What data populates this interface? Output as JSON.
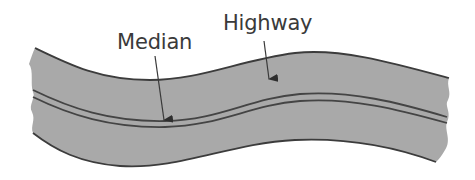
{
  "diagram": {
    "labels": {
      "median": "Median",
      "highway": "Highway"
    },
    "colors": {
      "road_fill": "#a9a9a9",
      "edge_stroke": "#3c3c3c",
      "text": "#3a3a3a",
      "background": "#ffffff"
    }
  }
}
